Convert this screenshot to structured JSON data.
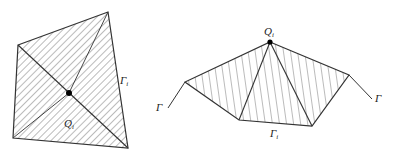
{
  "figures": [
    {
      "name": "left-figure",
      "vertices": [
        [
          18,
          45
        ],
        [
          108,
          12
        ],
        [
          128,
          148
        ],
        [
          13,
          138
        ]
      ],
      "center": [
        69,
        93
      ],
      "labels": {
        "point": {
          "text": "Q",
          "sub": "i"
        },
        "boundary": {
          "text": "Γ",
          "sub": "i"
        }
      }
    },
    {
      "name": "right-figure",
      "vertices": [
        [
          270,
          42
        ],
        [
          349,
          75
        ],
        [
          312,
          126
        ],
        [
          239,
          120
        ],
        [
          185,
          82
        ]
      ],
      "labels": {
        "point": {
          "text": "Q",
          "sub": "i"
        },
        "boundary": {
          "text": "Γ",
          "sub": "i"
        },
        "curve_left": {
          "text": "Γ"
        },
        "curve_right": {
          "text": "Γ"
        }
      }
    }
  ],
  "colors": {
    "stroke": "#333333",
    "hatch": "#555555",
    "dot": "#000000"
  }
}
